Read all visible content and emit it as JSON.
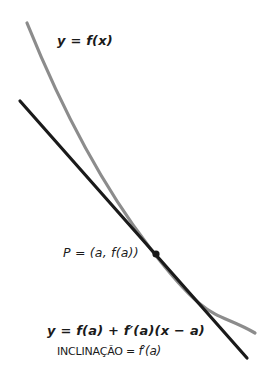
{
  "diagram": {
    "colors": {
      "background": "#ffffff",
      "curve": "#8c8c8c",
      "tangent": "#1a1a1a",
      "point": "#1a1a1a",
      "text": "#1a1a1a"
    },
    "curve": {
      "label": "y = f(x)",
      "path_points": [
        [
          27,
          23
        ],
        [
          59,
          100
        ],
        [
          114,
          200
        ],
        [
          156,
          254
        ],
        [
          180,
          275
        ],
        [
          200,
          295
        ],
        [
          235,
          320
        ],
        [
          255,
          333
        ]
      ]
    },
    "tangent_line": {
      "start": [
        20,
        101
      ],
      "end": [
        247,
        358
      ]
    },
    "point": {
      "label": "P = (a, f(a))",
      "position": [
        156,
        254
      ]
    },
    "tangent_equation": "y = f(a) + f′(a)(x − a)",
    "slope": {
      "word": "INCLINAÇÃO =",
      "value": "f′(a)"
    }
  }
}
